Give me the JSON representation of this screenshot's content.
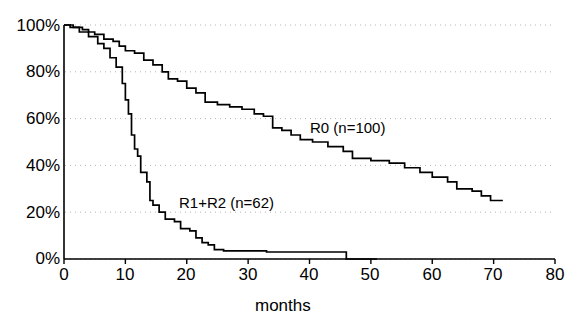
{
  "chart_data": {
    "type": "line",
    "subtype": "kaplan-meier-step",
    "title": "",
    "xlabel": "months",
    "ylabel": "",
    "xlim": [
      0,
      80
    ],
    "ylim": [
      0,
      100
    ],
    "xticks": [
      0,
      10,
      20,
      30,
      40,
      50,
      60,
      70,
      80
    ],
    "xticklabels": [
      "0",
      "10",
      "20",
      "30",
      "40",
      "50",
      "60",
      "70",
      "80"
    ],
    "yticks": [
      0,
      20,
      40,
      60,
      80,
      100
    ],
    "yticklabels": [
      "0%",
      "20%",
      "40%",
      "60%",
      "80%",
      "100%"
    ],
    "grid": "horizontal-dotted",
    "legend_position": "inline-annotation",
    "line_color": "#000000",
    "grid_color": "#b4b4b4",
    "axis_color": "#000000",
    "series": [
      {
        "name": "R0 (n=100)",
        "n": 100,
        "annotation": "R0 (n=100)",
        "annotation_x": 41,
        "annotation_y": 55,
        "final_survival_pct": 25,
        "max_followup_months": 71,
        "points": [
          [
            0,
            100
          ],
          [
            1.5,
            99
          ],
          [
            3.0,
            98
          ],
          [
            4.0,
            97
          ],
          [
            5.0,
            96
          ],
          [
            6.5,
            94
          ],
          [
            8.0,
            93
          ],
          [
            9.0,
            91
          ],
          [
            10.0,
            89
          ],
          [
            11.5,
            88
          ],
          [
            13.0,
            85
          ],
          [
            14.5,
            83
          ],
          [
            16.0,
            80
          ],
          [
            17.0,
            77
          ],
          [
            18.5,
            76
          ],
          [
            20.0,
            73
          ],
          [
            21.5,
            71
          ],
          [
            23.0,
            67
          ],
          [
            25.0,
            66
          ],
          [
            27.0,
            65
          ],
          [
            29.0,
            64
          ],
          [
            31.0,
            62
          ],
          [
            32.5,
            61
          ],
          [
            34.0,
            56
          ],
          [
            35.5,
            55
          ],
          [
            37.0,
            53
          ],
          [
            38.5,
            51
          ],
          [
            40.5,
            50
          ],
          [
            43.0,
            48
          ],
          [
            45.5,
            46
          ],
          [
            47.0,
            43
          ],
          [
            50.0,
            42
          ],
          [
            53.0,
            41
          ],
          [
            55.5,
            39
          ],
          [
            58.0,
            37
          ],
          [
            60.0,
            35
          ],
          [
            62.5,
            33
          ],
          [
            64.0,
            30
          ],
          [
            66.5,
            29
          ],
          [
            68.0,
            27
          ],
          [
            69.5,
            25
          ],
          [
            71.5,
            25
          ]
        ]
      },
      {
        "name": "R1+R2 (n=62)",
        "n": 62,
        "annotation": "R1+R2 (n=62)",
        "annotation_x": 22,
        "annotation_y": 24,
        "final_survival_pct": 0,
        "max_followup_months": 46,
        "points": [
          [
            0,
            100
          ],
          [
            1.0,
            99
          ],
          [
            2.5,
            97
          ],
          [
            4.0,
            95
          ],
          [
            5.5,
            92
          ],
          [
            6.5,
            90
          ],
          [
            7.5,
            86
          ],
          [
            8.5,
            82
          ],
          [
            9.5,
            75
          ],
          [
            10.0,
            68
          ],
          [
            10.5,
            62
          ],
          [
            11.0,
            53
          ],
          [
            11.5,
            47
          ],
          [
            12.0,
            44
          ],
          [
            12.5,
            37
          ],
          [
            13.5,
            33
          ],
          [
            14.0,
            25
          ],
          [
            14.5,
            23
          ],
          [
            15.5,
            20
          ],
          [
            16.5,
            17
          ],
          [
            18.0,
            16
          ],
          [
            19.0,
            13
          ],
          [
            20.5,
            12
          ],
          [
            21.5,
            9
          ],
          [
            22.5,
            7
          ],
          [
            23.5,
            6
          ],
          [
            24.5,
            4
          ],
          [
            26.0,
            3.5
          ],
          [
            32.0,
            3.5
          ],
          [
            33.0,
            3.0
          ],
          [
            45.5,
            3.0
          ],
          [
            46.0,
            0
          ],
          [
            51.0,
            0
          ]
        ]
      }
    ]
  },
  "axes": {
    "y_axis_name": "survival-axis",
    "x_axis_name": "months-axis"
  }
}
